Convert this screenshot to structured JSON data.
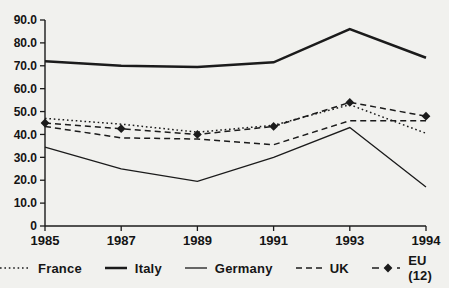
{
  "page": {
    "background": "#f1f1ee",
    "ink": "#1b1b1b",
    "text_color": "#141414"
  },
  "chart_data": {
    "type": "line",
    "title": "",
    "xlabel": "",
    "ylabel": "",
    "categories": [
      "1985",
      "1987",
      "1989",
      "1991",
      "1993",
      "1994"
    ],
    "series": [
      {
        "name": "France",
        "line_style": "dotted",
        "values": [
          47,
          44.5,
          41,
          44,
          53,
          40.5
        ]
      },
      {
        "name": "Italy",
        "line_style": "solid-thick",
        "values": [
          72,
          70,
          69.5,
          71.5,
          86,
          73.5
        ]
      },
      {
        "name": "Germany",
        "line_style": "solid-thin",
        "values": [
          34.5,
          25,
          19.5,
          30,
          43,
          17
        ]
      },
      {
        "name": "UK",
        "line_style": "dashed",
        "values": [
          43.5,
          38.5,
          38,
          35.5,
          46,
          46
        ]
      },
      {
        "name": "EU (12)",
        "line_style": "dash-diamond",
        "marker": "filled-diamond",
        "values": [
          45,
          42.5,
          40,
          43.5,
          54,
          48
        ]
      }
    ],
    "ylim": [
      0,
      90
    ],
    "ytick_interval": 10,
    "ytick_labels": [
      "0",
      "10.0",
      "20.0",
      "30.0",
      "40.0",
      "50.0",
      "60.0",
      "70.0",
      "80.0",
      "90.0"
    ],
    "grid": false,
    "legend_position": "bottom"
  }
}
